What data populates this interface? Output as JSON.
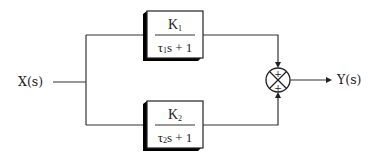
{
  "diagram": {
    "type": "block-diagram",
    "input": {
      "label": "X(s)"
    },
    "output": {
      "label": "Y(s)"
    },
    "blocks": [
      {
        "id": "G1",
        "numerator": "K",
        "numerator_sub": "1",
        "denominator_tau": "τ",
        "denominator_sub": "1",
        "denominator_rest": "s + 1"
      },
      {
        "id": "G2",
        "numerator": "K",
        "numerator_sub": "2",
        "denominator_tau": "τ",
        "denominator_sub": "2",
        "denominator_rest": "s + 1"
      }
    ],
    "summing_junction": {
      "top_sign": "+",
      "bottom_sign": "+"
    },
    "colors": {
      "line": "#333333",
      "shadow": "#000000",
      "background": "#ffffff"
    }
  }
}
